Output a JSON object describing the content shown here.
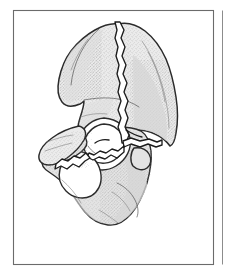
{
  "figure": {
    "style": "stippled medical line illustration",
    "background_color": "#ffffff",
    "bone_fill_color": "#ebebeb",
    "bone_outline_color": "#2b2b2b",
    "fracture_color": "#1c1c1c",
    "frame_color": "#6b6b6b"
  },
  "panels": {
    "main": {
      "name": "pelvis-illustration-panel",
      "x": 13,
      "y": 10,
      "width": 201,
      "height": 255
    },
    "adjacent": {
      "name": "adjacent-panel-edge",
      "x": 222,
      "y": 10,
      "width": 8,
      "height": 255
    }
  },
  "anatomy": {
    "regions": [
      {
        "id": "iliac-wing",
        "label": "Iliac wing"
      },
      {
        "id": "iliac-crest",
        "label": "Iliac crest"
      },
      {
        "id": "anterior-superior-iliac-spine",
        "label": "Anterior superior iliac spine"
      },
      {
        "id": "posterior-iliac-border",
        "label": "Posterior iliac border"
      },
      {
        "id": "auricular-surface",
        "label": "Auricular surface"
      },
      {
        "id": "greater-sciatic-notch",
        "label": "Greater sciatic notch"
      },
      {
        "id": "acetabulum",
        "label": "Acetabulum"
      },
      {
        "id": "obturator-foramen",
        "label": "Obturator foramen"
      },
      {
        "id": "superior-pubic-ramus",
        "label": "Superior pubic ramus"
      },
      {
        "id": "ischiopubic-ramus",
        "label": "Ischiopubic ramus"
      },
      {
        "id": "ischial-tuberosity",
        "label": "Ischial tuberosity"
      },
      {
        "id": "ischial-spine",
        "label": "Ischial spine"
      }
    ],
    "fractures": [
      {
        "id": "iliac-vertical-fracture",
        "label": "Vertical iliac wing fracture",
        "path_note": "runs from iliac crest inferiorly to acetabular roof"
      },
      {
        "id": "transverse-acetabular-fracture",
        "label": "Transverse acetabular fracture",
        "path_note": "crosses acetabulum toward posterior column"
      },
      {
        "id": "anterior-column-fracture",
        "label": "Anterior column fracture",
        "path_note": "extends into superior pubic ramus"
      },
      {
        "id": "ischiopubic-ramus-fracture",
        "label": "Ischiopubic ramus fracture",
        "path_note": "separates inferior ramus segment"
      }
    ]
  }
}
